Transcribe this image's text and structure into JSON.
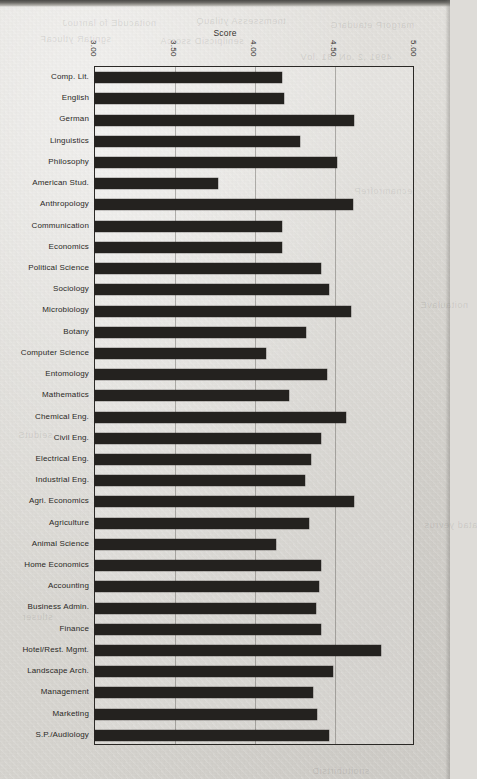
{
  "chart_data": {
    "type": "bar",
    "orientation": "horizontal",
    "title": "Score",
    "xlabel": "Score",
    "ylabel": "",
    "xlim": [
      3.0,
      5.0
    ],
    "xticks": [
      "3.00",
      "3.50",
      "4.00",
      "4.50",
      "5.00"
    ],
    "xtick_values": [
      3.0,
      3.5,
      4.0,
      4.5,
      5.0
    ],
    "grid": true,
    "legend": null,
    "bar_color": "#24221f",
    "categories": [
      "Comp. Lit.",
      "English",
      "German",
      "Linguistics",
      "Philosophy",
      "American Stud.",
      "Anthropology",
      "Communication",
      "Economics",
      "Political  Science",
      "Sociology",
      "Microbiology",
      "Botany",
      "Computer Science",
      "Entomology",
      "Mathematics",
      "Chemical Eng.",
      "Civil Eng.",
      "Electrical Eng.",
      "Industrial Eng.",
      "Agri. Economics",
      "Agriculture",
      "Animal Science",
      "Home Economics",
      "Accounting",
      "Business Admin.",
      "Finance",
      "Hotel/Rest. Mgmt.",
      "Landscape Arch.",
      "Management",
      "Marketing",
      "S.P./Audiology"
    ],
    "values": [
      4.17,
      4.18,
      4.62,
      4.28,
      4.51,
      3.77,
      4.61,
      4.17,
      4.17,
      4.41,
      4.46,
      4.6,
      4.32,
      4.07,
      4.45,
      4.21,
      4.57,
      4.41,
      4.35,
      4.31,
      4.62,
      4.34,
      4.13,
      4.41,
      4.4,
      4.38,
      4.41,
      4.79,
      4.49,
      4.36,
      4.39,
      4.46
    ]
  },
  "ghosts": [
    {
      "text": "noitacudE fo lanruoJ",
      "x": 62,
      "y": 18
    },
    {
      "text": "tnemssessA ytilauQ",
      "x": 196,
      "y": 16
    },
    {
      "text": "margorP etaudarG",
      "x": 330,
      "y": 20
    },
    {
      "text": "sgnitaR ytlucaF",
      "x": 40,
      "y": 34
    },
    {
      "text": "senilpicsiD ssorcA",
      "x": 160,
      "y": 36
    },
    {
      "text": "4991 ,2 .oN ,81 .loV",
      "x": 300,
      "y": 52
    },
    {
      "text": "ecnamrofreP",
      "x": 354,
      "y": 186
    },
    {
      "text": "noitaulavE",
      "x": 420,
      "y": 300
    },
    {
      "text": "seidutS",
      "x": 18,
      "y": 430
    },
    {
      "text": "atad yevrus",
      "x": 424,
      "y": 520
    },
    {
      "text": "stluser",
      "x": 22,
      "y": 612
    },
    {
      "text": "snoitubirtsiD",
      "x": 312,
      "y": 766
    }
  ]
}
